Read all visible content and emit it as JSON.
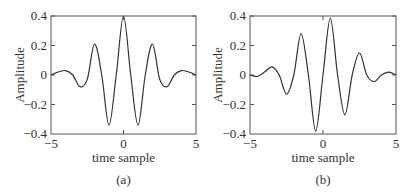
{
  "chart_data": [
    {
      "type": "line",
      "panel": "(a)",
      "caption": "(a)",
      "xlabel": "time sample",
      "ylabel": "Amplitude",
      "xlim": [
        -5,
        5
      ],
      "ylim": [
        -0.4,
        0.4
      ],
      "xticks": [
        "-5",
        "0",
        "5"
      ],
      "yticks": [
        "0.4",
        "0.2",
        "0",
        "-0.2",
        "-0.4"
      ],
      "grid": false,
      "legend": null,
      "series": [
        {
          "name": "wavelet (a)",
          "x": [
            -5,
            -4.5,
            -4,
            -3.5,
            -3,
            -2.5,
            -2,
            -1.5,
            -1,
            -0.5,
            0,
            0.5,
            1,
            1.5,
            2,
            2.5,
            3,
            3.5,
            4,
            4.5,
            5
          ],
          "y": [
            0.0,
            0.02,
            0.03,
            0.0,
            -0.08,
            -0.03,
            0.21,
            0.0,
            -0.34,
            0.0,
            0.4,
            0.0,
            -0.34,
            0.0,
            0.21,
            -0.03,
            -0.08,
            0.0,
            0.03,
            0.02,
            0.0
          ]
        }
      ]
    },
    {
      "type": "line",
      "panel": "(b)",
      "caption": "(b)",
      "xlabel": "time sample",
      "ylabel": "Amplitude",
      "xlim": [
        -5,
        5
      ],
      "ylim": [
        -0.4,
        0.4
      ],
      "xticks": [
        "-5",
        "0",
        "5"
      ],
      "yticks": [
        "0.4",
        "0.2",
        "0",
        "-0.2",
        "-0.4"
      ],
      "grid": false,
      "legend": null,
      "series": [
        {
          "name": "wavelet (b)",
          "x": [
            -5,
            -4.5,
            -4,
            -3.5,
            -3,
            -2.5,
            -2,
            -1.5,
            -1,
            -0.5,
            0,
            0.5,
            1,
            1.5,
            2,
            2.5,
            3,
            3.5,
            4,
            4.5,
            5
          ],
          "y": [
            0.0,
            -0.01,
            0.02,
            0.055,
            0.0,
            -0.13,
            0.0,
            0.28,
            0.0,
            -0.38,
            0.0,
            0.385,
            0.0,
            -0.27,
            0.0,
            0.15,
            0.0,
            -0.045,
            0.0,
            0.02,
            0.0
          ]
        }
      ]
    }
  ],
  "labels": {
    "a": {
      "xlabel": "time sample",
      "ylabel": "Amplitude",
      "caption": "(a)",
      "yt0": "0.4",
      "yt1": "0.2",
      "yt2": "0",
      "yt3": "−0.2",
      "yt4": "−0.4",
      "xt0": "−5",
      "xt1": "0",
      "xt2": "5"
    },
    "b": {
      "xlabel": "time sample",
      "ylabel": "Amplitude",
      "caption": "(b)",
      "yt0": "0.4",
      "yt1": "0.2",
      "yt2": "0",
      "yt3": "−0.2",
      "yt4": "−0.4",
      "xt0": "−5",
      "xt1": "0",
      "xt2": "5"
    }
  },
  "colors": {
    "axis": "#555555",
    "line": "#333333"
  }
}
